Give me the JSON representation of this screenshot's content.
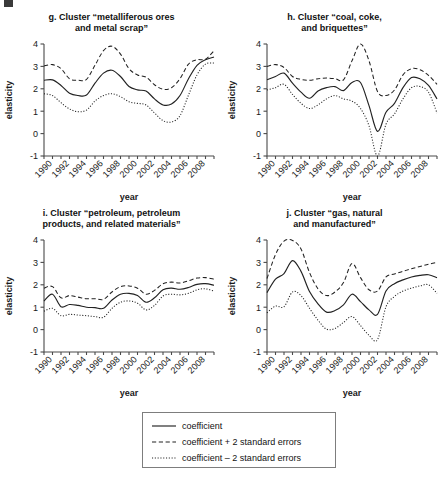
{
  "figure": {
    "y_axis_label": "elasticity",
    "x_axis_label": "year"
  },
  "legend": {
    "items": [
      {
        "label": "coefficient",
        "style": "solid"
      },
      {
        "label": "coefficient + 2 standard errors",
        "style": "dashed"
      },
      {
        "label": "coefficient – 2 standard errors",
        "style": "dotted"
      }
    ]
  },
  "chart_data": [
    {
      "type": "line",
      "panel": "g",
      "title": "g. Cluster “metalliferous ores\nand metal scrap”",
      "title_lines": [
        "g. Cluster “metalliferous ores",
        "and metal scrap”"
      ],
      "xlabel": "year",
      "ylabel": "elasticity",
      "ylim": [
        -1,
        4
      ],
      "yticks": [
        -1,
        0,
        1,
        2,
        3,
        4
      ],
      "xlim": [
        1989,
        2009
      ],
      "xticks": [
        1990,
        1992,
        1994,
        1996,
        1998,
        2000,
        2002,
        2004,
        2006,
        2008
      ],
      "x": [
        1989,
        1990,
        1991,
        1992,
        1993,
        1994,
        1995,
        1996,
        1997,
        1998,
        1999,
        2000,
        2001,
        2002,
        2003,
        2004,
        2005,
        2006,
        2007,
        2008,
        2009
      ],
      "series": [
        {
          "name": "coefficient",
          "style": "solid",
          "values": [
            2.38,
            2.4,
            2.15,
            1.8,
            1.7,
            1.72,
            2.25,
            2.7,
            2.83,
            2.55,
            2.1,
            1.95,
            1.9,
            1.55,
            1.28,
            1.32,
            1.7,
            2.45,
            3.05,
            3.3,
            3.42
          ]
        },
        {
          "name": "coefficient + 2 standard errors",
          "style": "dashed",
          "values": [
            3.02,
            3.08,
            2.9,
            2.45,
            2.38,
            2.42,
            3.05,
            3.7,
            3.9,
            3.55,
            2.9,
            2.62,
            2.52,
            2.18,
            1.98,
            2.05,
            2.45,
            3.1,
            3.3,
            3.32,
            3.7
          ]
        },
        {
          "name": "coefficient – 2 standard errors",
          "style": "dotted",
          "values": [
            1.78,
            1.7,
            1.38,
            1.1,
            0.98,
            1.05,
            1.45,
            1.7,
            1.78,
            1.65,
            1.42,
            1.35,
            1.28,
            0.92,
            0.58,
            0.52,
            0.8,
            1.72,
            2.62,
            3.1,
            3.15
          ]
        }
      ]
    },
    {
      "type": "line",
      "panel": "h",
      "title": "h. Cluster “coal, coke,\nand briquettes”",
      "title_lines": [
        "h. Cluster “coal, coke,",
        "and briquettes”"
      ],
      "xlabel": "year",
      "ylabel": "elasticity",
      "ylim": [
        -1,
        4
      ],
      "yticks": [
        -1,
        0,
        1,
        2,
        3,
        4
      ],
      "xlim": [
        1989,
        2009
      ],
      "xticks": [
        1990,
        1992,
        1994,
        1996,
        1998,
        2000,
        2002,
        2004,
        2006,
        2008
      ],
      "x": [
        1989,
        1990,
        1991,
        1992,
        1993,
        1994,
        1995,
        1996,
        1997,
        1998,
        1999,
        2000,
        2001,
        2002,
        2003,
        2004,
        2005,
        2006,
        2007,
        2008,
        2009
      ],
      "series": [
        {
          "name": "coefficient",
          "style": "solid",
          "values": [
            2.4,
            2.55,
            2.7,
            2.25,
            1.85,
            1.58,
            1.9,
            2.05,
            2.1,
            1.92,
            2.28,
            2.28,
            1.25,
            0.1,
            0.95,
            1.35,
            2.05,
            2.5,
            2.45,
            2.15,
            1.55
          ]
        },
        {
          "name": "coefficient + 2 standard errors",
          "style": "dashed",
          "values": [
            3.0,
            3.08,
            2.95,
            2.55,
            2.42,
            2.38,
            2.45,
            2.48,
            2.45,
            2.4,
            3.25,
            4.0,
            3.25,
            1.88,
            1.7,
            1.95,
            2.62,
            2.9,
            2.85,
            2.6,
            2.2
          ]
        },
        {
          "name": "coefficient – 2 standard errors",
          "style": "dotted",
          "values": [
            1.95,
            2.05,
            2.2,
            1.75,
            1.35,
            1.12,
            1.28,
            1.55,
            1.7,
            1.55,
            1.45,
            1.12,
            0.35,
            -1.0,
            0.42,
            0.88,
            1.55,
            2.05,
            2.1,
            1.85,
            0.92
          ]
        }
      ]
    },
    {
      "type": "line",
      "panel": "i",
      "title": "i. Cluster “petroleum, petroleum\nproducts, and related materials”",
      "title_lines": [
        "i. Cluster “petroleum, petroleum",
        "products, and related materials”"
      ],
      "xlabel": "year",
      "ylabel": "elasticity",
      "ylim": [
        -1,
        4
      ],
      "yticks": [
        -1,
        0,
        1,
        2,
        3,
        4
      ],
      "xlim": [
        1989,
        2009
      ],
      "xticks": [
        1990,
        1992,
        1994,
        1996,
        1998,
        2000,
        2002,
        2004,
        2006,
        2008
      ],
      "x": [
        1989,
        1990,
        1991,
        1992,
        1993,
        1994,
        1995,
        1996,
        1997,
        1998,
        1999,
        2000,
        2001,
        2002,
        2003,
        2004,
        2005,
        2006,
        2007,
        2008,
        2009
      ],
      "series": [
        {
          "name": "coefficient",
          "style": "solid",
          "values": [
            1.28,
            1.58,
            1.02,
            1.12,
            1.08,
            1.0,
            0.98,
            0.95,
            1.32,
            1.58,
            1.62,
            1.52,
            1.22,
            1.42,
            1.78,
            1.85,
            1.8,
            1.88,
            2.02,
            2.05,
            1.98
          ]
        },
        {
          "name": "coefficient + 2 standard errors",
          "style": "dashed",
          "values": [
            1.85,
            1.92,
            1.42,
            1.52,
            1.45,
            1.38,
            1.38,
            1.35,
            1.68,
            1.92,
            1.95,
            1.85,
            1.58,
            1.75,
            2.05,
            2.12,
            2.08,
            2.18,
            2.3,
            2.32,
            2.25
          ]
        },
        {
          "name": "coefficient – 2 standard errors",
          "style": "dotted",
          "values": [
            0.82,
            0.95,
            0.62,
            0.68,
            0.65,
            0.62,
            0.58,
            0.55,
            0.95,
            1.22,
            1.28,
            1.18,
            0.88,
            1.08,
            1.5,
            1.58,
            1.55,
            1.62,
            1.78,
            1.82,
            1.72
          ]
        }
      ]
    },
    {
      "type": "line",
      "panel": "j",
      "title": "j. Cluster “gas, natural\nand manufactured”",
      "title_lines": [
        "j. Cluster “gas, natural",
        "and manufactured”"
      ],
      "xlabel": "year",
      "ylabel": "elasticity",
      "ylim": [
        -1,
        4
      ],
      "yticks": [
        -1,
        0,
        1,
        2,
        3,
        4
      ],
      "xlim": [
        1989,
        2009
      ],
      "xticks": [
        1990,
        1992,
        1994,
        1996,
        1998,
        2000,
        2002,
        2004,
        2006,
        2008
      ],
      "x": [
        1989,
        1990,
        1991,
        1992,
        1993,
        1994,
        1995,
        1996,
        1997,
        1998,
        1999,
        2000,
        2001,
        2002,
        2003,
        2004,
        2005,
        2006,
        2007,
        2008,
        2009
      ],
      "series": [
        {
          "name": "coefficient",
          "style": "solid",
          "values": [
            1.65,
            2.25,
            2.5,
            3.08,
            2.6,
            1.7,
            1.15,
            0.78,
            0.85,
            1.1,
            1.58,
            1.25,
            0.88,
            0.68,
            1.72,
            2.05,
            2.22,
            2.35,
            2.42,
            2.45,
            2.32
          ]
        },
        {
          "name": "coefficient + 2 standard errors",
          "style": "dashed",
          "values": [
            2.28,
            3.35,
            3.95,
            3.98,
            3.6,
            2.55,
            1.82,
            1.52,
            1.68,
            2.1,
            2.95,
            2.32,
            1.78,
            1.72,
            2.35,
            2.48,
            2.6,
            2.72,
            2.82,
            2.92,
            3.0
          ]
        },
        {
          "name": "coefficient – 2 standard errors",
          "style": "dotted",
          "values": [
            0.75,
            1.05,
            1.02,
            1.68,
            1.52,
            0.95,
            0.42,
            0.02,
            0.05,
            0.32,
            0.58,
            0.18,
            -0.25,
            -0.45,
            1.02,
            1.48,
            1.72,
            1.85,
            1.95,
            2.0,
            1.62
          ]
        }
      ]
    }
  ]
}
